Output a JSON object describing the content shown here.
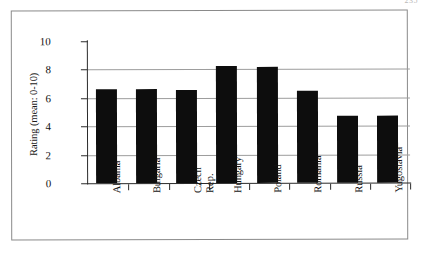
{
  "page": {
    "page_number": "235"
  },
  "chart_data": {
    "type": "bar",
    "title": "",
    "xlabel": "",
    "ylabel": "Rating (mean: 0-10)",
    "ylim": [
      0,
      10
    ],
    "yticks": [
      0,
      2,
      4,
      6,
      8,
      10
    ],
    "ytick_labels": [
      "0",
      "2",
      "4",
      "6",
      "8",
      "10"
    ],
    "gridlines": [
      2,
      4,
      6,
      8
    ],
    "grid": true,
    "legend": null,
    "bar_color": "#0d0d0d",
    "categories": [
      "Albania",
      "Czech Rep.",
      "Bulgaria",
      "Hungary",
      "Poland",
      "Romania",
      "Russia",
      "Yugoslavia"
    ],
    "category_labels": [
      {
        "line1": "Albania",
        "line2": ""
      },
      {
        "line1": "Bulgaria",
        "line2": ""
      },
      {
        "line1": "Czech",
        "line2": "Rep."
      },
      {
        "line1": "Hungary",
        "line2": ""
      },
      {
        "line1": "Poland",
        "line2": ""
      },
      {
        "line1": "Romania",
        "line2": ""
      },
      {
        "line1": "Russia",
        "line2": ""
      },
      {
        "line1": "Yugoslavia",
        "line2": ""
      }
    ],
    "values": [
      6.65,
      6.6,
      6.55,
      8.25,
      8.2,
      6.45,
      4.75,
      4.7
    ]
  }
}
